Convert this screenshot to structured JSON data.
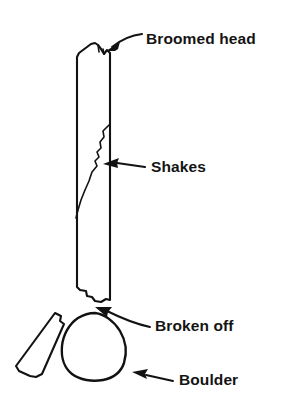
{
  "figure": {
    "kind": "line-diagram",
    "background_color": "#ffffff",
    "ink_color": "#121212",
    "text_color": "#141414"
  },
  "labels": [
    {
      "id": "broomed-head",
      "text": "Broomed head",
      "x": 146,
      "y": 44,
      "points_to": "top end of the timber post"
    },
    {
      "id": "shakes",
      "text": "Shakes",
      "x": 151,
      "y": 172,
      "points_to": "longitudinal split running down the post"
    },
    {
      "id": "broken-off",
      "text": "Broken off",
      "x": 155,
      "y": 331,
      "points_to": "fractured lower end of the post"
    },
    {
      "id": "boulder",
      "text": "Boulder",
      "x": 179,
      "y": 385,
      "points_to": "rock beneath the post"
    }
  ],
  "parts": [
    {
      "id": "timber-post",
      "name": "Timber post",
      "description": "Tall vertical member with frayed top and fractured base"
    },
    {
      "id": "shake-crack",
      "name": "Shake crack",
      "description": "Zig-zag vertical split in the post"
    },
    {
      "id": "broken-fragment",
      "name": "Broken fragment",
      "description": "Detached tilted piece of timber lying left of the boulder"
    },
    {
      "id": "boulder",
      "name": "Boulder",
      "description": "Rounded rock supporting the post base"
    }
  ],
  "leaders": [
    {
      "id": "leader-broomed-head",
      "from_label": "broomed-head",
      "arrow_tip": [
        108,
        48
      ]
    },
    {
      "id": "leader-shakes",
      "from_label": "shakes",
      "arrow_tip": [
        105,
        164
      ]
    },
    {
      "id": "leader-broken-off",
      "from_label": "broken-off",
      "arrow_tip": [
        97,
        309
      ]
    },
    {
      "id": "leader-boulder",
      "from_label": "boulder",
      "arrow_tip": [
        133,
        373
      ]
    }
  ]
}
